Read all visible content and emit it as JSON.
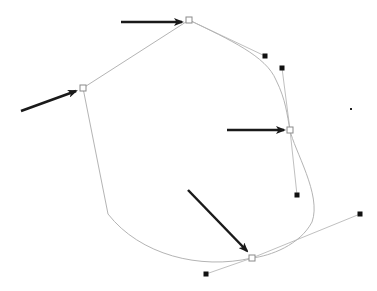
{
  "diagram": {
    "title": "",
    "colors": {
      "background": "#ffffff",
      "path_stroke": "#b4b4b4",
      "handle_line": "#c0c0c0",
      "anchor_stroke": "#8a8a8a",
      "handle_fill": "#111111",
      "arrow": "#1a1a1a"
    },
    "path": {
      "d": "M 83 88 L 189 20 C 230 40, 266 56, 276 80 C 286 100, 287 115, 290 130 C 294 150, 322 195, 312 222 C 300 245, 270 256, 252 258 C 200 270, 140 255, 108 214 Z"
    },
    "anchors": [
      {
        "name": "anchor-left",
        "x": 83,
        "y": 88,
        "selected": false
      },
      {
        "name": "anchor-top",
        "x": 189,
        "y": 20,
        "selected": false
      },
      {
        "name": "anchor-right",
        "x": 290,
        "y": 130,
        "selected": false
      },
      {
        "name": "anchor-bottom",
        "x": 252,
        "y": 258,
        "selected": false
      }
    ],
    "corner_points": [
      {
        "name": "corner-bottom-left",
        "x": 108,
        "y": 214
      }
    ],
    "handles": [
      {
        "name": "handle-top-out",
        "anchor": "anchor-top",
        "x": 265,
        "y": 56
      },
      {
        "name": "handle-right-in",
        "anchor": "anchor-right",
        "x": 282,
        "y": 68
      },
      {
        "name": "handle-right-out",
        "anchor": "anchor-right",
        "x": 297,
        "y": 195
      },
      {
        "name": "handle-bottom-in",
        "anchor": "anchor-bottom",
        "x": 360,
        "y": 214
      },
      {
        "name": "handle-bottom-out",
        "anchor": "anchor-bottom",
        "x": 206,
        "y": 274
      }
    ],
    "stray_dots": [
      {
        "name": "stray-dot",
        "x": 351,
        "y": 109
      }
    ],
    "arrows": [
      {
        "name": "arrow-to-top-anchor",
        "x1": 121,
        "y1": 22,
        "x2": 182,
        "y2": 22
      },
      {
        "name": "arrow-to-left-anchor",
        "x1": 21,
        "y1": 111,
        "x2": 76,
        "y2": 91
      },
      {
        "name": "arrow-to-right-anchor",
        "x1": 227,
        "y1": 130,
        "x2": 284,
        "y2": 130
      },
      {
        "name": "arrow-to-bottom-anchor",
        "x1": 188,
        "y1": 190,
        "x2": 247,
        "y2": 251
      }
    ]
  }
}
